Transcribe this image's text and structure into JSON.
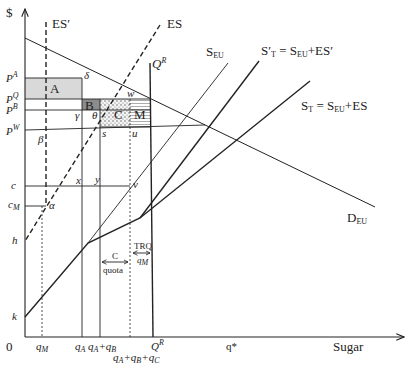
{
  "diagram": {
    "axes": {
      "y_label": "$",
      "x_label": "Sugar",
      "origin": "0"
    },
    "curves": {
      "es_prime": "ES′",
      "es": "ES",
      "s_eu": "S",
      "s_eu_sub": "EU",
      "s_t_prime": "S′",
      "s_t_prime_sub": "T",
      "s_t_prime_eq": " = S",
      "s_t_prime_eq_sub": "EU",
      "s_t_prime_tail": "+ES′",
      "s_t": "S",
      "s_t_sub": "T",
      "s_t_eq": " = S",
      "s_t_eq_sub": "EU",
      "s_t_tail": "+ES",
      "d_eu": "D",
      "d_eu_sub": "EU",
      "q_r_top": "Q",
      "q_r_top_sup": "R"
    },
    "y_ticks": {
      "p_a": "P",
      "p_a_sup": "A",
      "p_q": "P",
      "p_q_sup": "Q",
      "p_b": "P",
      "p_b_sup": "B",
      "p_w": "P",
      "p_w_sup": "W",
      "c": "c",
      "c_m": "c",
      "c_m_sub": "M",
      "h": "h",
      "k": "k"
    },
    "x_ticks": {
      "q_m": "q",
      "q_m_sub": "M",
      "q_a": "q",
      "q_a_sub": "A",
      "q_ab": "q",
      "q_ab_sub1": "A",
      "q_ab_mid": "+q",
      "q_ab_sub2": "B",
      "q_abc": "q",
      "q_abc_sub1": "A",
      "q_abc_mid1": "+q",
      "q_abc_sub2": "B",
      "q_abc_mid2": "+q",
      "q_abc_sub3": "C",
      "q_r": "Q",
      "q_r_sup": "R",
      "q_star": "q*"
    },
    "areas": {
      "a": "A",
      "b": "B",
      "c": "C",
      "m": "M"
    },
    "points": {
      "delta": "δ",
      "w": "w",
      "gamma": "γ",
      "theta": "θ",
      "s": "s",
      "u": "u",
      "beta": "β",
      "x": "x",
      "y": "y",
      "v": "v",
      "alpha": "α"
    },
    "annotations": {
      "c_quota_top": "C",
      "c_quota_bottom": "quota",
      "trq_top": "TRQ",
      "trq_bottom": "q",
      "trq_bottom_sub": "M"
    },
    "colors": {
      "line": "#222222",
      "area_a": "#d9d9d9",
      "area_b": "#8c8c8c"
    }
  }
}
